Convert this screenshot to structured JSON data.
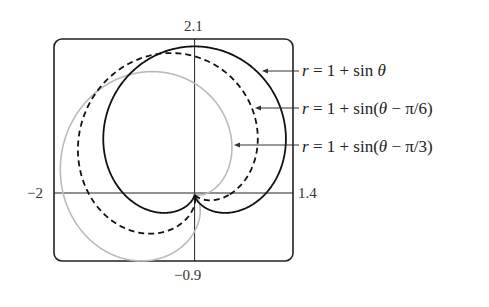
{
  "chart_data": {
    "type": "line",
    "subtype": "polar",
    "title": "",
    "xlabel": "",
    "ylabel": "",
    "xlim": [
      -2,
      1.4
    ],
    "ylim": [
      -0.9,
      2.1
    ],
    "grid": false,
    "tick_labels": {
      "x_min": "−2",
      "x_max": "1.4",
      "y_max": "2.1",
      "y_min": "−0.9"
    },
    "series": [
      {
        "name": "r = 1 + sin θ",
        "equation": "r = 1 + sin(θ)",
        "phase": 0,
        "style": "solid",
        "color": "#111111"
      },
      {
        "name": "r = 1 + sin(θ − π/6)",
        "equation": "r = 1 + sin(θ - π/6)",
        "phase": 0.5235987756,
        "style": "dashed",
        "color": "#111111"
      },
      {
        "name": "r = 1 + sin(θ − π/3)",
        "equation": "r = 1 + sin(θ - π/3)",
        "phase": 1.0471975512,
        "style": "solid",
        "color": "#bbbbbb"
      }
    ],
    "legend_position": "right, with arrows pointing to curves"
  },
  "labels": {
    "ymax": "2.1",
    "ymin": "−0.9",
    "xmin": "−2",
    "xmax": "1.4"
  },
  "legend": [
    {
      "prefix": "r",
      "text": " = 1 + sin ",
      "var": "θ",
      "suffix": ""
    },
    {
      "prefix": "r",
      "text": " = 1 + sin(",
      "var": "θ",
      "suffix": " − π/6)"
    },
    {
      "prefix": "r",
      "text": " = 1 + sin(",
      "var": "θ",
      "suffix": " − π/3)"
    }
  ]
}
